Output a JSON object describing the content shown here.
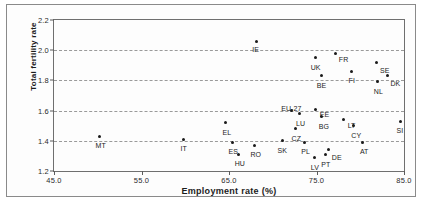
{
  "chart_data": {
    "type": "scatter",
    "title": "",
    "xlabel": "Employment rate (%)",
    "ylabel": "Total fertility rate",
    "xlim": [
      45.0,
      85.0
    ],
    "ylim": [
      1.2,
      2.2
    ],
    "xticks": [
      "45.0",
      "55.0",
      "65.0",
      "75.0",
      "85.0"
    ],
    "yticks": [
      "2.2",
      "2.0",
      "1.8",
      "1.6",
      "1.4",
      "1.2"
    ],
    "grid": "horizontal-dashed",
    "legend": "none",
    "points": [
      {
        "label": "IE",
        "x": 68.1,
        "y": 2.06,
        "lx": -4,
        "ly": 5
      },
      {
        "label": "FR",
        "x": 77.2,
        "y": 1.98,
        "lx": 3,
        "ly": 3
      },
      {
        "label": "UK",
        "x": 74.9,
        "y": 1.95,
        "lx": -5,
        "ly": 6
      },
      {
        "label": "SE",
        "x": 81.9,
        "y": 1.92,
        "lx": 3,
        "ly": 5
      },
      {
        "label": "BE",
        "x": 75.6,
        "y": 1.83,
        "lx": -5,
        "ly": 6
      },
      {
        "label": "FI",
        "x": 79.0,
        "y": 1.86,
        "lx": -3,
        "ly": 6
      },
      {
        "label": "DK",
        "x": 83.1,
        "y": 1.83,
        "lx": 3,
        "ly": 4
      },
      {
        "label": "NL",
        "x": 82.0,
        "y": 1.79,
        "lx": -4,
        "ly": 6
      },
      {
        "label": "EU-27",
        "x": 72.1,
        "y": 1.6,
        "lx": -10,
        "ly": -6
      },
      {
        "label": "EE",
        "x": 74.9,
        "y": 1.61,
        "lx": 4,
        "ly": 2
      },
      {
        "label": "LU",
        "x": 73.0,
        "y": 1.58,
        "lx": -3,
        "ly": 6
      },
      {
        "label": "BG",
        "x": 75.6,
        "y": 1.56,
        "lx": -3,
        "ly": 6
      },
      {
        "label": "LT",
        "x": 78.1,
        "y": 1.54,
        "lx": 4,
        "ly": 2
      },
      {
        "label": "SI",
        "x": 84.6,
        "y": 1.53,
        "lx": -4,
        "ly": 6
      },
      {
        "label": "EL",
        "x": 64.6,
        "y": 1.52,
        "lx": -3,
        "ly": 6
      },
      {
        "label": "CY",
        "x": 79.2,
        "y": 1.5,
        "lx": -2,
        "ly": 6
      },
      {
        "label": "CZ",
        "x": 72.6,
        "y": 1.48,
        "lx": -4,
        "ly": 6
      },
      {
        "label": "MT",
        "x": 50.2,
        "y": 1.43,
        "lx": -4,
        "ly": 6
      },
      {
        "label": "IT",
        "x": 59.8,
        "y": 1.41,
        "lx": -3,
        "ly": 6
      },
      {
        "label": "SK",
        "x": 71.1,
        "y": 1.4,
        "lx": -5,
        "ly": 6
      },
      {
        "label": "PL",
        "x": 73.6,
        "y": 1.39,
        "lx": -3,
        "ly": 6
      },
      {
        "label": "AT",
        "x": 80.3,
        "y": 1.39,
        "lx": -3,
        "ly": 6
      },
      {
        "label": "ES",
        "x": 65.4,
        "y": 1.39,
        "lx": -4,
        "ly": 6
      },
      {
        "label": "RO",
        "x": 67.9,
        "y": 1.37,
        "lx": -4,
        "ly": 6
      },
      {
        "label": "DE",
        "x": 76.4,
        "y": 1.34,
        "lx": 3,
        "ly": 4
      },
      {
        "label": "HU",
        "x": 66.1,
        "y": 1.31,
        "lx": -4,
        "ly": 6
      },
      {
        "label": "PT",
        "x": 76.0,
        "y": 1.31,
        "lx": -4,
        "ly": 7
      },
      {
        "label": "LV",
        "x": 74.8,
        "y": 1.29,
        "lx": -4,
        "ly": 7
      }
    ]
  }
}
